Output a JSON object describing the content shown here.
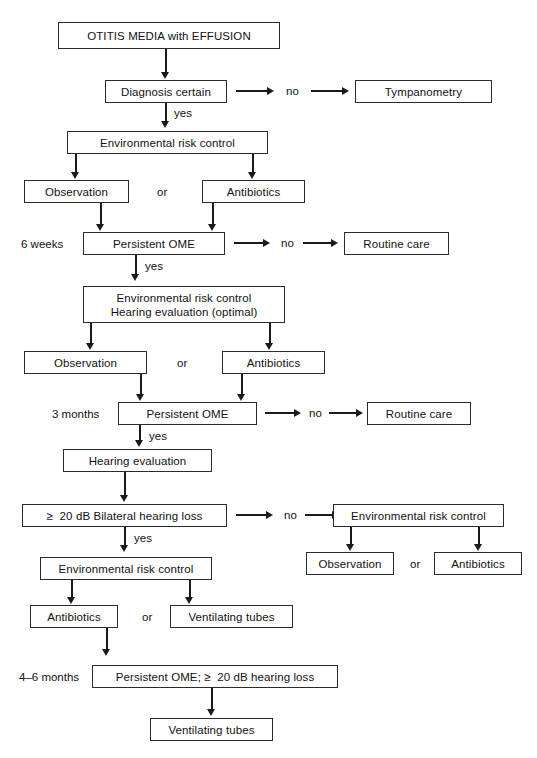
{
  "figure": {
    "type": "flowchart",
    "background": "#ffffff",
    "line_color": "#1a1a1a",
    "box_border_color": "#2b2b2b"
  },
  "nodes": {
    "start": "OTITIS MEDIA with EFFUSION",
    "diagnosis_certain": "Diagnosis certain",
    "tympanometry": "Tympanometry",
    "env_risk_control_1": "Environmental risk control",
    "observation_1": "Observation",
    "antibiotics_1": "Antibiotics",
    "persistent_ome_1": "Persistent OME",
    "routine_care_1": "Routine care",
    "env_risk_hearing_line1": "Environmental risk control",
    "env_risk_hearing_line2": "Hearing evaluation (optimal)",
    "observation_2": "Observation",
    "antibiotics_2": "Antibiotics",
    "persistent_ome_2": "Persistent OME",
    "routine_care_2": "Routine care",
    "hearing_evaluation": "Hearing evaluation",
    "bilateral_hearing_loss": "≥  20 dB Bilateral hearing loss",
    "env_risk_control_right": "Environmental risk control",
    "observation_right": "Observation",
    "antibiotics_right": "Antibiotics",
    "env_risk_control_2": "Environmental risk control",
    "antibiotics_3": "Antibiotics",
    "ventilating_tubes_1": "Ventilating tubes",
    "persistent_ome_hearing_loss": "Persistent OME; ≥  20 dB hearing loss",
    "ventilating_tubes_2": "Ventilating tubes"
  },
  "labels": {
    "no_1": "no",
    "no_2": "no",
    "no_3": "no",
    "no_4": "no",
    "yes_1": "yes",
    "yes_2": "yes",
    "yes_3": "yes",
    "yes_4": "yes",
    "or_1": "or",
    "or_2": "or",
    "or_3": "or",
    "or_4": "or",
    "timeline_6_weeks": "6 weeks",
    "timeline_3_months": "3 months",
    "timeline_4_6_months": "4–6 months"
  }
}
